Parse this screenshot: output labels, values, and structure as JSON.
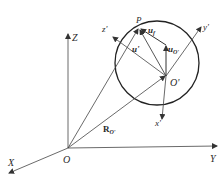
{
  "diagram": {
    "type": "coordinate-frame-vector-diagram",
    "global_frame": {
      "origin": "O",
      "axes": [
        "X",
        "Y",
        "Z"
      ]
    },
    "local_frame": {
      "origin": "O'",
      "axes": [
        "x'",
        "y'",
        "z'"
      ]
    },
    "point": "P",
    "vectors": {
      "R_origin": {
        "symbol": "R",
        "subscript": "O'"
      },
      "u_prime": {
        "symbol": "u'"
      },
      "u_f": {
        "symbol": "u",
        "subscript": "f"
      },
      "u_O": {
        "symbol": "u",
        "subscript": "O'"
      }
    },
    "colors": {
      "line": "#3a3a3a",
      "background": "#ffffff"
    }
  },
  "labels": {
    "O": "O",
    "X": "X",
    "Y": "Y",
    "Z": "Z",
    "O_prime": "O'",
    "x_prime": "x'",
    "y_prime": "y'",
    "z_prime": "z'",
    "P": "P",
    "R_main": "R",
    "R_sub": "O'",
    "u_prime": "u'",
    "uf_main": "u",
    "uf_sub": "f",
    "uO_main": "u",
    "uO_sub": "O'"
  }
}
